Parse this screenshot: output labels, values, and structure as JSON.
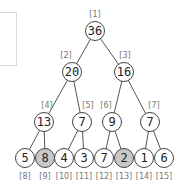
{
  "diagram": {
    "type": "binary-heap-tree",
    "colors": {
      "node_fill": "#ffffff",
      "node_highlight_fill": "#c8c8c8",
      "node_stroke": "#444444",
      "edge": "#555555",
      "index_text": "#777777"
    },
    "nodes": [
      {
        "index": "[1]",
        "value": "36",
        "highlighted": false
      },
      {
        "index": "[2]",
        "value": "20",
        "highlighted": false
      },
      {
        "index": "[3]",
        "value": "16",
        "highlighted": false
      },
      {
        "index": "[4]",
        "value": "13",
        "highlighted": false
      },
      {
        "index": "[5]",
        "value": "7",
        "highlighted": false
      },
      {
        "index": "[6]",
        "value": "9",
        "highlighted": false
      },
      {
        "index": "[7]",
        "value": "7",
        "highlighted": false
      },
      {
        "index": "[8]",
        "value": "5",
        "highlighted": false
      },
      {
        "index": "[9]",
        "value": "8",
        "highlighted": true
      },
      {
        "index": "[10]",
        "value": "4",
        "highlighted": false
      },
      {
        "index": "[11]",
        "value": "3",
        "highlighted": false
      },
      {
        "index": "[12]",
        "value": "7",
        "highlighted": false
      },
      {
        "index": "[13]",
        "value": "2",
        "highlighted": true
      },
      {
        "index": "[14]",
        "value": "1",
        "highlighted": false
      },
      {
        "index": "[15]",
        "value": "6",
        "highlighted": false
      }
    ]
  }
}
